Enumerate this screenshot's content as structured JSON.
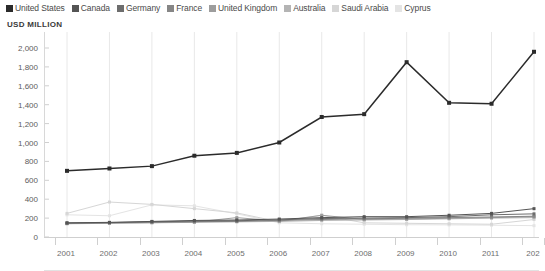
{
  "axis_title": "USD MILLION",
  "legend": {
    "items": [
      {
        "label": "United States",
        "color": "#2b2b2b"
      },
      {
        "label": "Canada",
        "color": "#545454"
      },
      {
        "label": "Germany",
        "color": "#6d6d6d"
      },
      {
        "label": "France",
        "color": "#868686"
      },
      {
        "label": "United Kingdom",
        "color": "#9d9d9d"
      },
      {
        "label": "Australia",
        "color": "#b4b4b4"
      },
      {
        "label": "Saudi Arabia",
        "color": "#d6d6d6"
      },
      {
        "label": "Cyprus",
        "color": "#e4e4e4"
      }
    ]
  },
  "chart_data": {
    "type": "line",
    "title": "",
    "xlabel": "",
    "ylabel": "USD MILLION",
    "ylim": [
      0,
      2000
    ],
    "ytick_labels": [
      "0",
      "200",
      "400",
      "600",
      "800",
      "1,000",
      "1,200",
      "1,400",
      "1,600",
      "1,800",
      "2,000"
    ],
    "ytick_values": [
      0,
      200,
      400,
      600,
      800,
      1000,
      1200,
      1400,
      1600,
      1800,
      2000
    ],
    "grid": true,
    "grid_axis": "x",
    "legend_position": "top",
    "markers": "square",
    "categories": [
      "2001",
      "2002",
      "2003",
      "2004",
      "2005",
      "2006",
      "2007",
      "2008",
      "2009",
      "2010",
      "2011",
      "2012"
    ],
    "xtick_labels": [
      "2001",
      "2002",
      "2003",
      "2004",
      "2005",
      "2006",
      "2007",
      "2008",
      "2009",
      "2010",
      "2011",
      "202"
    ],
    "series": [
      {
        "name": "United States",
        "color": "#2b2b2b",
        "values": [
          700,
          725,
          750,
          860,
          890,
          1000,
          1270,
          1300,
          1850,
          1420,
          1410,
          1960
        ]
      },
      {
        "name": "Canada",
        "color": "#545454",
        "values": [
          150,
          155,
          165,
          175,
          180,
          190,
          205,
          215,
          215,
          230,
          250,
          300
        ]
      },
      {
        "name": "Germany",
        "color": "#6d6d6d",
        "values": [
          148,
          152,
          160,
          168,
          172,
          182,
          195,
          200,
          205,
          215,
          235,
          245
        ]
      },
      {
        "name": "France",
        "color": "#868686",
        "values": [
          145,
          150,
          158,
          162,
          165,
          175,
          185,
          192,
          198,
          205,
          212,
          220
        ]
      },
      {
        "name": "United Kingdom",
        "color": "#9d9d9d",
        "values": [
          142,
          148,
          152,
          158,
          205,
          168,
          230,
          185,
          190,
          198,
          205,
          215
        ]
      },
      {
        "name": "Australia",
        "color": "#b4b4b4",
        "values": [
          140,
          145,
          150,
          155,
          160,
          165,
          175,
          180,
          185,
          192,
          200,
          205
        ]
      },
      {
        "name": "Saudi Arabia",
        "color": "#d6d6d6",
        "values": [
          250,
          370,
          345,
          300,
          255,
          160,
          230,
          150,
          145,
          140,
          135,
          185
        ]
      },
      {
        "name": "Cyprus",
        "color": "#e4e4e4",
        "values": [
          235,
          225,
          340,
          330,
          245,
          150,
          140,
          135,
          130,
          128,
          125,
          120
        ]
      }
    ]
  }
}
